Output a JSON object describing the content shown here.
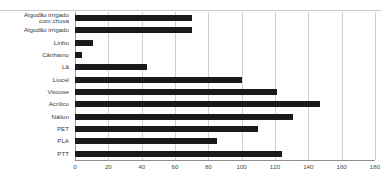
{
  "header": {
    "top_note": ""
  },
  "chart_data": {
    "type": "bar",
    "orientation": "horizontal",
    "title": "",
    "xlabel": "",
    "ylabel": "",
    "xlim": [
      0,
      180
    ],
    "xticks": [
      0,
      20,
      40,
      60,
      80,
      100,
      120,
      140,
      160,
      180
    ],
    "ticklabels": [
      "0",
      "20",
      "40",
      "60",
      "80",
      "100",
      "120",
      "140",
      "160",
      "180"
    ],
    "grid": true,
    "grid_axis": "x",
    "legend": false,
    "bar_color": "#1a1a1a",
    "grid_color": "#d0d0d0",
    "categories": [
      "Algodão irrigado\ncom chuva",
      "Algodão irrigado",
      "Linho",
      "Cânhamo",
      "Lã",
      "Liocel",
      "Viscose",
      "Acrílico",
      "Náilon",
      "PET",
      "PLA",
      "PTT"
    ],
    "values": [
      70,
      70,
      11,
      4,
      43,
      100,
      121,
      147,
      131,
      110,
      85,
      124
    ]
  }
}
